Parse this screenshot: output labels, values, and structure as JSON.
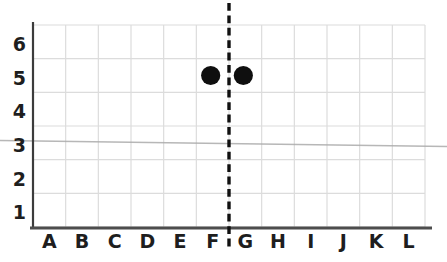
{
  "chart_data": {
    "type": "scatter",
    "title": "",
    "xlabel": "",
    "ylabel": "",
    "categories": [
      "A",
      "B",
      "C",
      "D",
      "E",
      "F",
      "G",
      "H",
      "I",
      "J",
      "K",
      "L"
    ],
    "y_ticks": [
      1,
      2,
      3,
      4,
      5,
      6
    ],
    "ylim": [
      0,
      6
    ],
    "grid": true,
    "points": [
      {
        "x": "F",
        "y": 5
      },
      {
        "x": "G",
        "y": 5
      }
    ],
    "divider_line": {
      "orientation": "vertical",
      "style": "dashed",
      "between": [
        "F",
        "G"
      ],
      "extends_beyond_grid": true
    },
    "scan_artifact_line": {
      "orientation": "horizontal",
      "near_y_value": 3,
      "style": "faint-gray-full-width"
    },
    "colors": {
      "background": "#ffffff",
      "gridline": "#dcdcdc",
      "y_axis": "#3c3c3c",
      "x_axis": "#4d4d4d",
      "label": "#1e1e1e",
      "point": "#0f0f0f",
      "divider": "#101010",
      "artifact": "#ababab"
    }
  }
}
